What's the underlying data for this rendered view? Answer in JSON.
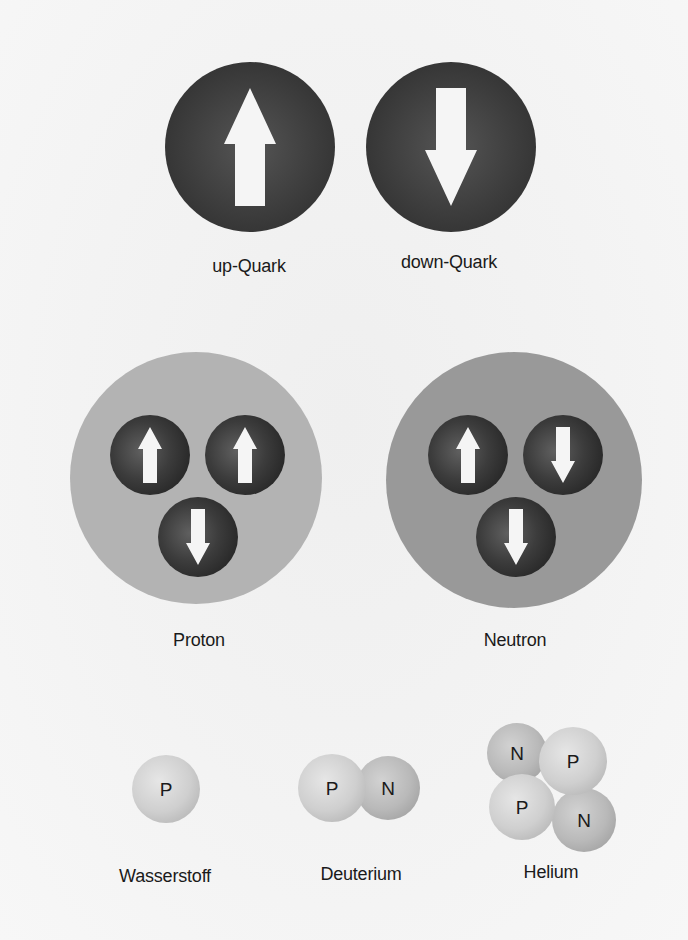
{
  "diagram": {
    "quarks": {
      "up": {
        "label": "up-Quark",
        "arrow": "up",
        "cx": 250,
        "cy": 147,
        "r": 85
      },
      "down": {
        "label": "down-Quark",
        "arrow": "down",
        "cx": 451,
        "cy": 147,
        "r": 85
      }
    },
    "nucleons": [
      {
        "id": "proton",
        "label": "Proton",
        "cx": 196,
        "cy": 478,
        "r": 126,
        "fill": "#b3b3b3",
        "quarks": [
          {
            "type": "up",
            "cx": 150,
            "cy": 455
          },
          {
            "type": "up",
            "cx": 245,
            "cy": 455
          },
          {
            "type": "down",
            "cx": 198,
            "cy": 537
          }
        ]
      },
      {
        "id": "neutron",
        "label": "Neutron",
        "cx": 514,
        "cy": 480,
        "r": 128,
        "fill": "#999999",
        "quarks": [
          {
            "type": "up",
            "cx": 468,
            "cy": 455
          },
          {
            "type": "down",
            "cx": 563,
            "cy": 455
          },
          {
            "type": "down",
            "cx": 516,
            "cy": 537
          }
        ]
      }
    ],
    "nuclei": [
      {
        "id": "wasserstoff",
        "label": "Wasserstoff",
        "particles": [
          {
            "letter": "P",
            "cx": 166,
            "cy": 789,
            "r": 34
          }
        ]
      },
      {
        "id": "deuterium",
        "label": "Deuterium",
        "particles": [
          {
            "letter": "N",
            "cx": 388,
            "cy": 788,
            "r": 32
          },
          {
            "letter": "P",
            "cx": 332,
            "cy": 788,
            "r": 34
          }
        ]
      },
      {
        "id": "helium",
        "label": "Helium",
        "particles": [
          {
            "letter": "N",
            "cx": 517,
            "cy": 753,
            "r": 30
          },
          {
            "letter": "N",
            "cx": 584,
            "cy": 820,
            "r": 32
          },
          {
            "letter": "P",
            "cx": 573,
            "cy": 761,
            "r": 34
          },
          {
            "letter": "P",
            "cx": 522,
            "cy": 807,
            "r": 33
          }
        ]
      }
    ],
    "labels": {
      "up_quark": "up-Quark",
      "down_quark": "down-Quark",
      "proton": "Proton",
      "neutron": "Neutron",
      "wasserstoff": "Wasserstoff",
      "deuterium": "Deuterium",
      "helium": "Helium"
    },
    "letters": {
      "proton": "P",
      "neutron": "N"
    },
    "colors": {
      "quark_dark": "#3a3a3a",
      "quark_light": "#5a5a5a",
      "arrow": "#f5f5f5",
      "proton_bg": "#b3b3b3",
      "neutron_bg": "#999999",
      "proton_ball": "#d2d2d2",
      "neutron_ball": "#bdbdbd",
      "text": "#1a1a1a"
    }
  }
}
